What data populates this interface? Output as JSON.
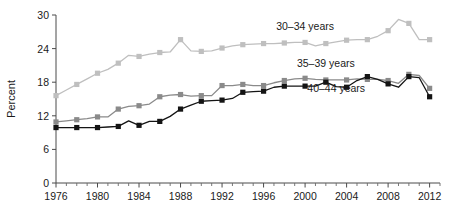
{
  "chart_data": {
    "type": "line",
    "title": "",
    "xlabel": "",
    "ylabel": "Percent",
    "ylim": [
      0,
      30
    ],
    "xlim": [
      1976,
      2013
    ],
    "ytick_values": [
      0,
      6,
      12,
      18,
      24,
      30
    ],
    "ytick_labels": [
      "0",
      "6",
      "12",
      "18",
      "24",
      "30"
    ],
    "xtick_values": [
      1976,
      1980,
      1984,
      1988,
      1992,
      1996,
      2000,
      2004,
      2008,
      2012
    ],
    "xtick_labels": [
      "1976",
      "1980",
      "1984",
      "1988",
      "1992",
      "1996",
      "2000",
      "2004",
      "2008",
      "2012"
    ],
    "minor_xtick_step": 1,
    "grid": false,
    "legend_position": "inline-annotations",
    "marker": "square",
    "x": [
      1976,
      1977,
      1978,
      1979,
      1980,
      1981,
      1982,
      1983,
      1984,
      1985,
      1986,
      1987,
      1988,
      1989,
      1990,
      1991,
      1992,
      1993,
      1994,
      1995,
      1996,
      1997,
      1998,
      1999,
      2000,
      2001,
      2002,
      2003,
      2004,
      2005,
      2006,
      2007,
      2008,
      2009,
      2010,
      2011,
      2012
    ],
    "series": [
      {
        "name": "30-34 years",
        "label": "30–34 years",
        "color": "#bfbfbf",
        "label_x": 2000,
        "label_y": 27.4,
        "values": [
          15.6,
          16.6,
          17.6,
          18.6,
          19.6,
          20.3,
          21.4,
          22.8,
          22.6,
          23.0,
          23.3,
          23.4,
          25.6,
          23.6,
          23.5,
          23.6,
          24.1,
          24.5,
          24.7,
          24.8,
          24.9,
          24.9,
          25.0,
          25.1,
          25.1,
          24.5,
          24.9,
          25.2,
          25.5,
          25.6,
          25.6,
          26.2,
          27.2,
          29.2,
          28.5,
          25.6,
          25.6
        ]
      },
      {
        "name": "35-39 years",
        "label": "35–39 years",
        "color": "#8a8a8a",
        "label_x": 2002,
        "label_y": 20.8,
        "values": [
          10.9,
          11.1,
          11.3,
          11.5,
          11.8,
          11.8,
          13.2,
          13.7,
          13.8,
          14.1,
          15.4,
          15.7,
          15.8,
          15.5,
          15.6,
          15.6,
          17.4,
          17.4,
          17.6,
          17.4,
          17.4,
          17.9,
          18.3,
          18.6,
          18.7,
          18.5,
          18.4,
          18.4,
          18.4,
          18.6,
          18.5,
          18.5,
          18.3,
          17.8,
          19.4,
          19.2,
          16.9
        ]
      },
      {
        "name": "40-44 years",
        "label": "40–44 years",
        "color": "#141414",
        "label_x": 2003,
        "label_y": 16.2,
        "values": [
          9.9,
          9.9,
          9.9,
          9.9,
          9.9,
          10.0,
          10.1,
          11.1,
          10.3,
          11.0,
          11.0,
          11.9,
          13.2,
          13.9,
          14.6,
          14.7,
          14.8,
          15.1,
          16.2,
          16.3,
          16.4,
          17.1,
          17.3,
          17.3,
          17.3,
          17.3,
          18.0,
          17.2,
          17.1,
          18.3,
          19.0,
          18.5,
          17.7,
          17.1,
          19.0,
          18.8,
          15.4
        ]
      }
    ]
  },
  "axis": {
    "ylabel": "Percent"
  }
}
